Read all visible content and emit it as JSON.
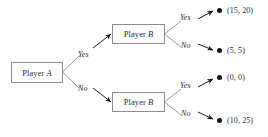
{
  "diagram": {
    "type": "game-tree",
    "background_color": "#ffffff",
    "line_color": "#8d8d8d",
    "arrow_color": "#1a1a1a",
    "text_color": "#2b2b2b",
    "nodes": [
      {
        "id": "root",
        "label_prefix": "Player",
        "label_id": "A",
        "full_label": "Player A"
      },
      {
        "id": "b_up",
        "label_prefix": "Player",
        "label_id": "B",
        "full_label": "Player B"
      },
      {
        "id": "b_down",
        "label_prefix": "Player",
        "label_id": "B",
        "full_label": "Player B"
      }
    ],
    "edges": [
      {
        "from": "root",
        "to": "b_up",
        "label": "Yes"
      },
      {
        "from": "root",
        "to": "b_down",
        "label": "No"
      },
      {
        "from": "b_up",
        "to": "t1",
        "label": "Yes"
      },
      {
        "from": "b_up",
        "to": "t2",
        "label": "No"
      },
      {
        "from": "b_down",
        "to": "t3",
        "label": "Yes"
      },
      {
        "from": "b_down",
        "to": "t4",
        "label": "No"
      }
    ],
    "terminals": [
      {
        "id": "t1",
        "payoff": "(15, 20)",
        "player_a": 15,
        "player_b": 20
      },
      {
        "id": "t2",
        "payoff": "(5, 5)",
        "player_a": 5,
        "player_b": 5
      },
      {
        "id": "t3",
        "payoff": "(0, 0)",
        "player_a": 0,
        "player_b": 0
      },
      {
        "id": "t4",
        "payoff": "(10, 25)",
        "player_a": 10,
        "player_b": 25
      }
    ]
  }
}
